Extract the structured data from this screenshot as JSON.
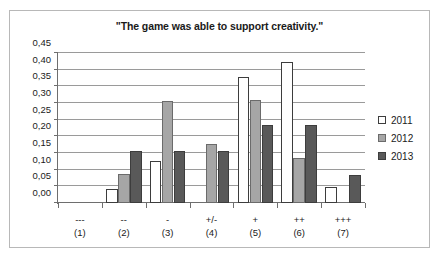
{
  "chart_data": {
    "type": "bar",
    "title": "\"The game was able to support creativity.\"",
    "xlabel": "",
    "ylabel": "",
    "ylim": [
      0,
      0.45
    ],
    "ytick_labels": [
      "0,00",
      "0,05",
      "0,10",
      "0,15",
      "0,20",
      "0,25",
      "0,30",
      "0,35",
      "0,40",
      "0,45"
    ],
    "ytick_values": [
      0.0,
      0.05,
      0.1,
      0.15,
      0.2,
      0.25,
      0.3,
      0.35,
      0.4,
      0.45
    ],
    "grid": true,
    "legend_position": "right",
    "categories": [
      "---",
      "--",
      "-",
      "+/-",
      "+",
      "++",
      "+++"
    ],
    "category_numbers": [
      "(1)",
      "(2)",
      "(3)",
      "(4)",
      "(5)",
      "(6)",
      "(7)"
    ],
    "series": [
      {
        "name": "2011",
        "color": "#ffffff",
        "values": [
          0.0,
          0.042,
          0.125,
          0.0,
          0.378,
          0.423,
          0.048
        ]
      },
      {
        "name": "2012",
        "color": "#a6a6a6",
        "values": [
          0.0,
          0.088,
          0.307,
          0.177,
          0.309,
          0.134,
          0.0
        ]
      },
      {
        "name": "2013",
        "color": "#595959",
        "values": [
          0.0,
          0.155,
          0.155,
          0.155,
          0.235,
          0.235,
          0.083
        ]
      }
    ]
  },
  "colors": {
    "series_2011": "#ffffff",
    "series_2012": "#a6a6a6",
    "series_2013": "#595959",
    "border": "#b8b8b8",
    "axis": "#6e6e6e",
    "gridline": "#9a9a9a",
    "text": "#1a1a1a"
  }
}
